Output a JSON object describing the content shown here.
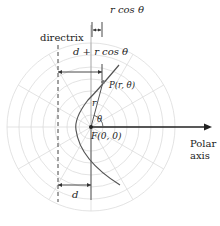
{
  "figure": {
    "labels": {
      "r_cos_theta": "r cos θ",
      "directrix": "directrix",
      "d_plus_r_cos_theta": "d + r cos θ",
      "point_p": "P(r, θ)",
      "r": "r",
      "theta": "θ",
      "focus": "F(0, 0)",
      "polar_axis_line1": "Polar",
      "polar_axis_line2": "axis",
      "d": "d"
    },
    "colors": {
      "grid": "#d9d9d9",
      "ink": "#333333",
      "curve": "#555555",
      "point": "#666666"
    }
  }
}
